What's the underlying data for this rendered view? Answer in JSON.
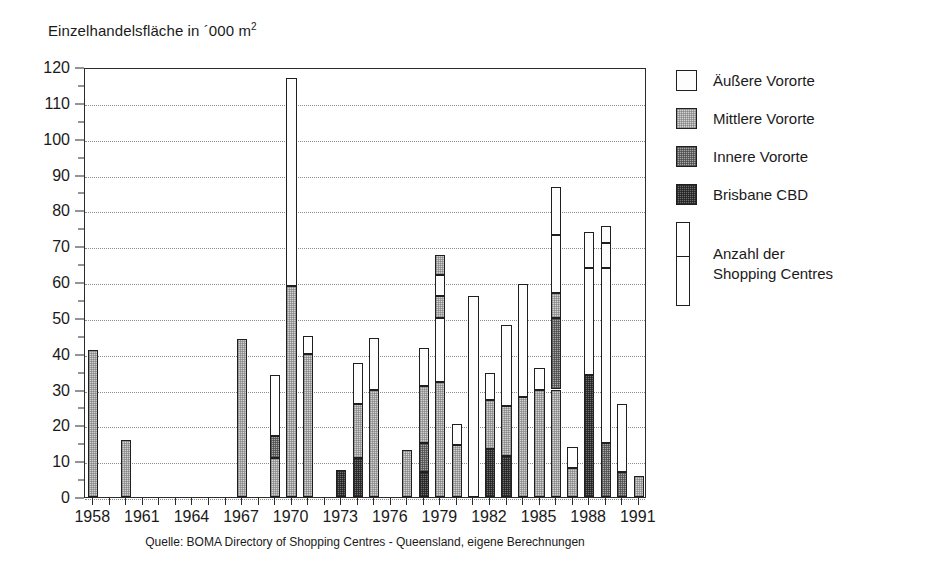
{
  "axis_title": {
    "text": "Einzelhandelsfläche in ´000 m",
    "superscript": "2"
  },
  "source_note": "Quelle: BOMA Directory of  Shopping Centres - Queensland, eigene Berechnungen",
  "legend": {
    "entries": [
      {
        "label": "Äußere Vororte",
        "key": "outer",
        "color": "#fdfdfd"
      },
      {
        "label": "Mittlere Vororte",
        "key": "middle",
        "color": "#d2d2d2"
      },
      {
        "label": "Innere Vororte",
        "key": "inner",
        "color": "#a8a8a8"
      },
      {
        "label": "Brisbane CBD",
        "key": "cbd",
        "color": "#6e6e6e"
      }
    ],
    "count_label_line1": "Anzahl der",
    "count_label_line2": "Shopping Centres"
  },
  "chart_data": {
    "type": "bar",
    "subtype": "stacked-bar",
    "title": "",
    "xlabel": "",
    "ylabel": "Einzelhandelsfläche in ´000 m2",
    "ylim": [
      0,
      120
    ],
    "ytick_step": 10,
    "yminor_step": 5,
    "grid": true,
    "legend_position": "right",
    "x": [
      1958,
      1959,
      1960,
      1961,
      1962,
      1963,
      1964,
      1965,
      1966,
      1967,
      1968,
      1969,
      1970,
      1971,
      1972,
      1973,
      1974,
      1975,
      1976,
      1977,
      1978,
      1979,
      1980,
      1981,
      1982,
      1983,
      1984,
      1985,
      1986,
      1987,
      1988,
      1989,
      1990,
      1991
    ],
    "xtick_labels": [
      "1958",
      "1961",
      "1964",
      "1967",
      "1970",
      "1973",
      "1976",
      "1979",
      "1982",
      "1985",
      "1988",
      "1991"
    ],
    "xtick_label_years": [
      1958,
      1961,
      1964,
      1967,
      1970,
      1973,
      1976,
      1979,
      1982,
      1985,
      1988,
      1991
    ],
    "series": [
      {
        "name": "Brisbane CBD",
        "key": "cbd",
        "values": [
          0,
          0,
          0,
          0,
          0,
          0,
          0,
          0,
          0,
          0,
          0,
          0,
          0,
          0,
          0,
          7.5,
          11,
          0,
          0,
          0,
          7,
          0,
          0,
          0,
          13.5,
          11.5,
          0,
          0,
          0,
          0,
          34,
          0,
          0,
          0
        ]
      },
      {
        "name": "Innere Vororte",
        "key": "inner",
        "values": [
          0,
          0,
          0,
          0,
          0,
          0,
          0,
          0,
          0,
          0,
          0,
          6,
          0,
          0,
          0,
          0,
          0,
          0,
          0,
          0,
          8,
          0,
          0,
          0,
          0,
          0,
          0,
          0,
          0,
          8,
          0,
          15,
          7,
          0
        ]
      },
      {
        "name": "Mittlere Vororte",
        "key": "middle",
        "values": [
          41,
          0,
          16,
          0,
          0,
          0,
          0,
          0,
          0,
          44,
          0,
          11,
          59,
          40,
          0,
          0,
          15,
          30,
          0,
          13,
          16,
          32,
          14.5,
          0,
          13.5,
          14,
          28,
          30,
          30,
          6,
          0,
          0,
          0,
          6
        ]
      },
      {
        "name": "Äußere Vororte",
        "key": "outer",
        "values": [
          0,
          0,
          0,
          0,
          0,
          0,
          0,
          0,
          0,
          0,
          0,
          17,
          58,
          5,
          0,
          0,
          11.5,
          14.5,
          0,
          0,
          10.5,
          35.5,
          6,
          56,
          7.5,
          22.5,
          31.5,
          6,
          56.5,
          0,
          40,
          60.5,
          19,
          0
        ]
      }
    ],
    "bars": [
      {
        "year": 1958,
        "total": 41,
        "segments": [
          {
            "key": "middle",
            "from": 0,
            "to": 41
          }
        ]
      },
      {
        "year": 1960,
        "total": 16,
        "segments": [
          {
            "key": "middle",
            "from": 0,
            "to": 16
          }
        ]
      },
      {
        "year": 1967,
        "total": 44,
        "segments": [
          {
            "key": "middle",
            "from": 0,
            "to": 44
          }
        ]
      },
      {
        "year": 1969,
        "total": 34,
        "segments": [
          {
            "key": "middle",
            "from": 0,
            "to": 11
          },
          {
            "key": "inner",
            "from": 11,
            "to": 17
          },
          {
            "key": "outer",
            "from": 17,
            "to": 34
          }
        ]
      },
      {
        "year": 1970,
        "total": 117,
        "segments": [
          {
            "key": "middle",
            "from": 0,
            "to": 59
          },
          {
            "key": "outer",
            "from": 59,
            "to": 117
          }
        ]
      },
      {
        "year": 1971,
        "total": 45,
        "segments": [
          {
            "key": "middle",
            "from": 0,
            "to": 40
          },
          {
            "key": "outer",
            "from": 40,
            "to": 45
          }
        ]
      },
      {
        "year": 1973,
        "total": 7.5,
        "segments": [
          {
            "key": "cbd",
            "from": 0,
            "to": 7.5
          }
        ]
      },
      {
        "year": 1974,
        "total": 37.5,
        "segments": [
          {
            "key": "cbd",
            "from": 0,
            "to": 11
          },
          {
            "key": "middle",
            "from": 11,
            "to": 26
          },
          {
            "key": "outer",
            "from": 26,
            "to": 37.5
          }
        ]
      },
      {
        "year": 1975,
        "total": 44.5,
        "segments": [
          {
            "key": "middle",
            "from": 0,
            "to": 30
          },
          {
            "key": "outer",
            "from": 30,
            "to": 44.5
          }
        ]
      },
      {
        "year": 1977,
        "total": 13,
        "segments": [
          {
            "key": "middle",
            "from": 0,
            "to": 13
          }
        ]
      },
      {
        "year": 1978,
        "total": 41.5,
        "segments": [
          {
            "key": "cbd",
            "from": 0,
            "to": 7
          },
          {
            "key": "inner",
            "from": 7,
            "to": 15
          },
          {
            "key": "middle",
            "from": 15,
            "to": 31
          },
          {
            "key": "outer",
            "from": 31,
            "to": 41.5
          }
        ]
      },
      {
        "year": 1979,
        "total": 67.5,
        "segments": [
          {
            "key": "middle",
            "from": 0,
            "to": 32
          },
          {
            "key": "outer",
            "from": 32,
            "to": 50
          },
          {
            "key": "middle",
            "from": 50,
            "to": 56
          },
          {
            "key": "outer",
            "from": 56,
            "to": 62
          },
          {
            "key": "middle",
            "from": 62,
            "to": 67.5
          }
        ]
      },
      {
        "year": 1980,
        "total": 20.5,
        "segments": [
          {
            "key": "middle",
            "from": 0,
            "to": 14.5
          },
          {
            "key": "outer",
            "from": 14.5,
            "to": 20.5
          }
        ]
      },
      {
        "year": 1981,
        "total": 56,
        "segments": [
          {
            "key": "outer",
            "from": 0,
            "to": 56
          }
        ]
      },
      {
        "year": 1982,
        "total": 34.5,
        "segments": [
          {
            "key": "cbd",
            "from": 0,
            "to": 13.5
          },
          {
            "key": "middle",
            "from": 13.5,
            "to": 27
          },
          {
            "key": "outer",
            "from": 27,
            "to": 34.5
          }
        ]
      },
      {
        "year": 1983,
        "total": 48,
        "segments": [
          {
            "key": "cbd",
            "from": 0,
            "to": 11.5
          },
          {
            "key": "middle",
            "from": 11.5,
            "to": 25.5
          },
          {
            "key": "outer",
            "from": 25.5,
            "to": 48
          }
        ]
      },
      {
        "year": 1984,
        "total": 59.5,
        "segments": [
          {
            "key": "middle",
            "from": 0,
            "to": 28
          },
          {
            "key": "outer",
            "from": 28,
            "to": 59.5
          }
        ]
      },
      {
        "year": 1985,
        "total": 36,
        "segments": [
          {
            "key": "middle",
            "from": 0,
            "to": 30
          },
          {
            "key": "outer",
            "from": 30,
            "to": 36
          }
        ]
      },
      {
        "year": 1986,
        "total": 86.5,
        "segments": [
          {
            "key": "middle",
            "from": 0,
            "to": 30
          },
          {
            "key": "inner",
            "from": 30,
            "to": 50
          },
          {
            "key": "middle",
            "from": 50,
            "to": 57
          },
          {
            "key": "outer",
            "from": 57,
            "to": 73
          },
          {
            "key": "outer",
            "from": 73,
            "to": 86.5
          }
        ]
      },
      {
        "year": 1987,
        "total": 14,
        "segments": [
          {
            "key": "middle",
            "from": 0,
            "to": 8
          },
          {
            "key": "outer",
            "from": 8,
            "to": 14
          }
        ]
      },
      {
        "year": 1988,
        "total": 74,
        "segments": [
          {
            "key": "cbd",
            "from": 0,
            "to": 34
          },
          {
            "key": "outer",
            "from": 34,
            "to": 64
          },
          {
            "key": "outer",
            "from": 64,
            "to": 74
          }
        ]
      },
      {
        "year": 1989,
        "total": 75.5,
        "segments": [
          {
            "key": "inner",
            "from": 0,
            "to": 15
          },
          {
            "key": "outer",
            "from": 15,
            "to": 64
          },
          {
            "key": "outer",
            "from": 64,
            "to": 71
          },
          {
            "key": "outer",
            "from": 71,
            "to": 75.5
          }
        ]
      },
      {
        "year": 1990,
        "total": 26,
        "segments": [
          {
            "key": "inner",
            "from": 0,
            "to": 7
          },
          {
            "key": "outer",
            "from": 7,
            "to": 26
          }
        ]
      },
      {
        "year": 1991,
        "total": 6,
        "segments": [
          {
            "key": "middle",
            "from": 0,
            "to": 6
          }
        ]
      }
    ]
  }
}
